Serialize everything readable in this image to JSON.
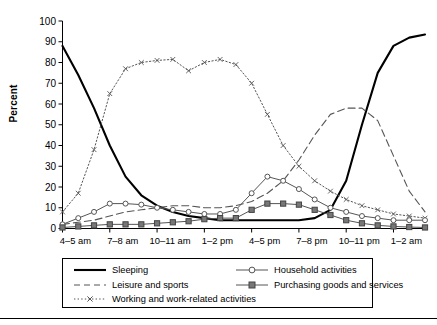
{
  "axis": {
    "ylabel": "Percent",
    "yticks": [
      0,
      10,
      20,
      30,
      40,
      50,
      60,
      70,
      80,
      90,
      100
    ],
    "xtick_labels": [
      "4–5 am",
      "7–8 am",
      "10–11 am",
      "1–2 pm",
      "4–5 pm",
      "7–8 pm",
      "10–11 pm",
      "1–2 am"
    ]
  },
  "legend": {
    "rows": [
      [
        {
          "label": "Sleeping",
          "icon": "solid-line-swatch",
          "key": "sleeping"
        },
        {
          "label": "Household activities",
          "icon": "line-open-circle-swatch",
          "key": "household"
        }
      ],
      [
        {
          "label": "Leisure and sports",
          "icon": "dashed-line-swatch",
          "key": "leisure"
        },
        {
          "label": "Purchasing goods and services",
          "icon": "line-filled-square-swatch",
          "key": "purchasing"
        }
      ],
      [
        {
          "label": "Working and work-related activities",
          "icon": "dotted-line-x-swatch",
          "key": "working"
        }
      ]
    ]
  },
  "chart_data": {
    "type": "line",
    "title": "",
    "xlabel": "",
    "ylabel": "Percent",
    "ylim": [
      0,
      100
    ],
    "grid": false,
    "legend_position": "below-plot",
    "x": [
      "4–5 am",
      "5–6 am",
      "6–7 am",
      "7–8 am",
      "8–9 am",
      "9–10 am",
      "10–11 am",
      "11 am–12 pm",
      "12–1 pm",
      "1–2 pm",
      "2–3 pm",
      "3–4 pm",
      "4–5 pm",
      "5–6 pm",
      "6–7 pm",
      "7–8 pm",
      "8–9 pm",
      "9–10 pm",
      "10–11 pm",
      "11 pm–12 am",
      "12–1 am",
      "1–2 am",
      "2–3 am",
      "3–4 am"
    ],
    "series": [
      {
        "name": "Sleeping",
        "style": "solid",
        "marker": "none",
        "color": "#000000",
        "width": 2.1,
        "values": [
          88,
          74,
          58,
          40,
          25,
          16,
          11,
          8,
          6,
          5,
          4,
          4,
          4,
          4,
          4,
          4,
          5,
          9,
          23,
          50,
          75,
          88,
          92,
          93.5
        ]
      },
      {
        "name": "Leisure and sports",
        "style": "dashed",
        "marker": "none",
        "color": "#555555",
        "width": 1.1,
        "values": [
          2,
          3,
          4,
          6,
          8,
          9,
          10,
          11,
          11,
          10,
          10,
          11,
          13,
          17,
          23,
          33,
          45,
          55,
          58,
          58,
          52,
          35,
          18,
          8
        ]
      },
      {
        "name": "Working and work-related activities",
        "style": "dotted",
        "marker": "x",
        "color": "#555555",
        "width": 1.0,
        "values": [
          8,
          17,
          38,
          65,
          77,
          80,
          81,
          81.5,
          76,
          80,
          81.5,
          79,
          70,
          55,
          40,
          30,
          23,
          18,
          14,
          11,
          9,
          7,
          6,
          5
        ]
      },
      {
        "name": "Household activities",
        "style": "solid",
        "marker": "circle",
        "color": "#555555",
        "width": 1.0,
        "values": [
          2,
          5,
          8,
          12,
          12,
          11.5,
          10,
          9,
          8,
          7,
          7,
          9,
          17,
          25,
          23,
          19,
          14,
          10,
          8,
          6,
          5,
          4,
          4,
          4
        ]
      },
      {
        "name": "Purchasing goods and services",
        "style": "solid",
        "marker": "square",
        "color": "#555555",
        "width": 1.0,
        "values": [
          0.5,
          1,
          1.5,
          2,
          2,
          2,
          2.5,
          3,
          3.5,
          4.5,
          5,
          5,
          9,
          12,
          12,
          11.5,
          9,
          6.5,
          4,
          2.5,
          1.5,
          1,
          0.7,
          0.5
        ]
      }
    ]
  }
}
